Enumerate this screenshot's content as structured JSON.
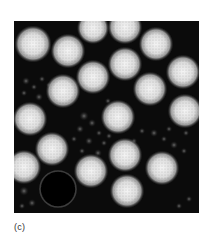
{
  "figure": {
    "panel_label": "(c)",
    "image": {
      "description": "negative-stain electron micrograph of icosahedral virus particles",
      "background_color": "#0b0b0b",
      "particle_color": "#e8e8e8",
      "particles": [
        {
          "cx": 19,
          "cy": 23,
          "r": 15
        },
        {
          "cx": 54,
          "cy": 30,
          "r": 14
        },
        {
          "cx": 79,
          "cy": 7,
          "r": 13
        },
        {
          "cx": 111,
          "cy": 6,
          "r": 14
        },
        {
          "cx": 142,
          "cy": 23,
          "r": 14
        },
        {
          "cx": 111,
          "cy": 43,
          "r": 14
        },
        {
          "cx": 79,
          "cy": 56,
          "r": 14
        },
        {
          "cx": 169,
          "cy": 51,
          "r": 14
        },
        {
          "cx": 49,
          "cy": 70,
          "r": 14
        },
        {
          "cx": 136,
          "cy": 68,
          "r": 14
        },
        {
          "cx": 16,
          "cy": 98,
          "r": 14
        },
        {
          "cx": 104,
          "cy": 96,
          "r": 14
        },
        {
          "cx": 171,
          "cy": 90,
          "r": 14
        },
        {
          "cx": 38,
          "cy": 128,
          "r": 14
        },
        {
          "cx": 111,
          "cy": 134,
          "r": 14
        },
        {
          "cx": 10,
          "cy": 146,
          "r": 14
        },
        {
          "cx": 77,
          "cy": 150,
          "r": 14
        },
        {
          "cx": 148,
          "cy": 147,
          "r": 14
        },
        {
          "cx": 113,
          "cy": 170,
          "r": 14
        }
      ],
      "ring": {
        "cx": 44,
        "cy": 168,
        "r": 18
      },
      "debris": [
        {
          "cx": 70,
          "cy": 95,
          "r": 3
        },
        {
          "cx": 78,
          "cy": 102,
          "r": 2.5
        },
        {
          "cx": 66,
          "cy": 108,
          "r": 2.5
        },
        {
          "cx": 85,
          "cy": 112,
          "r": 2
        },
        {
          "cx": 60,
          "cy": 118,
          "r": 2
        },
        {
          "cx": 75,
          "cy": 120,
          "r": 2.5
        },
        {
          "cx": 90,
          "cy": 122,
          "r": 2
        },
        {
          "cx": 68,
          "cy": 130,
          "r": 2
        },
        {
          "cx": 84,
          "cy": 132,
          "r": 2.5
        },
        {
          "cx": 95,
          "cy": 115,
          "r": 2
        },
        {
          "cx": 12,
          "cy": 60,
          "r": 2.5
        },
        {
          "cx": 20,
          "cy": 66,
          "r": 2
        },
        {
          "cx": 28,
          "cy": 58,
          "r": 2
        },
        {
          "cx": 10,
          "cy": 72,
          "r": 2
        },
        {
          "cx": 25,
          "cy": 76,
          "r": 2.5
        },
        {
          "cx": 35,
          "cy": 64,
          "r": 2
        },
        {
          "cx": 140,
          "cy": 112,
          "r": 2.5
        },
        {
          "cx": 150,
          "cy": 118,
          "r": 2
        },
        {
          "cx": 160,
          "cy": 124,
          "r": 2.5
        },
        {
          "cx": 170,
          "cy": 130,
          "r": 2
        },
        {
          "cx": 172,
          "cy": 112,
          "r": 2
        },
        {
          "cx": 155,
          "cy": 108,
          "r": 2
        },
        {
          "cx": 10,
          "cy": 170,
          "r": 3
        },
        {
          "cx": 18,
          "cy": 182,
          "r": 2.5
        },
        {
          "cx": 8,
          "cy": 185,
          "r": 2
        },
        {
          "cx": 175,
          "cy": 178,
          "r": 2
        },
        {
          "cx": 165,
          "cy": 185,
          "r": 2
        },
        {
          "cx": 94,
          "cy": 80,
          "r": 2
        },
        {
          "cx": 120,
          "cy": 120,
          "r": 2
        },
        {
          "cx": 128,
          "cy": 110,
          "r": 2
        }
      ]
    }
  }
}
